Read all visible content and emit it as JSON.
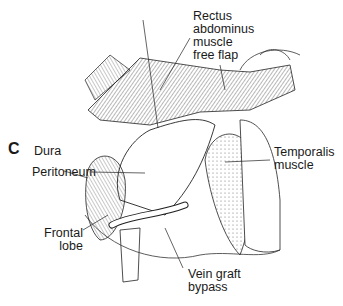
{
  "figure": {
    "panel_label": "C",
    "labels": {
      "rectus": [
        "Rectus",
        "abdominus",
        "muscle",
        "free flap"
      ],
      "temporalis": [
        "Temporalis",
        "muscle"
      ],
      "dura": "Dura",
      "peritoneum": "Peritoneum",
      "frontal": [
        "Frontal",
        "lobe"
      ],
      "vein": [
        "Vein graft",
        "bypass"
      ]
    }
  }
}
